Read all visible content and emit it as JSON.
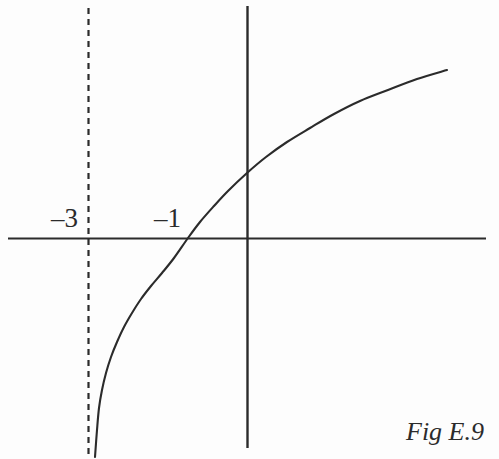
{
  "figure": {
    "caption": "Fig E.9",
    "background_color": "#fdfdfd",
    "ink_color": "#2b2b2b",
    "width": 499,
    "height": 459
  },
  "labels": {
    "neg_three": "–3",
    "neg_one": "–1"
  },
  "chart_data": {
    "type": "line",
    "title": "Fig E.9",
    "subtitle": "",
    "xlabel": "",
    "ylabel": "",
    "grid": false,
    "legend_position": "none",
    "axes": {
      "x_axis": {
        "pixel_y": 238,
        "pixel_x_start": 8,
        "pixel_x_end": 486,
        "visible": true
      },
      "y_axis": {
        "pixel_x": 247,
        "pixel_y_start": 6,
        "pixel_y_end": 448,
        "visible": true
      }
    },
    "tick_labels": [
      {
        "text": "–3",
        "axis": "x",
        "value": -3,
        "pixel_x": 88,
        "pixel_y": 238
      },
      {
        "text": "–1",
        "axis": "x",
        "value": -1,
        "pixel_x": 188,
        "pixel_y": 238
      }
    ],
    "annotations": [
      {
        "kind": "asymptote",
        "orientation": "vertical",
        "value": -3,
        "style": "dashed",
        "pixel_x": 88,
        "pixel_y_start": 8,
        "pixel_y_end": 456
      }
    ],
    "series": [
      {
        "name": "y = ln(x + 3)",
        "style": "solid",
        "color": "#2b2b2b",
        "points_pixels": [
          [
            95,
            457
          ],
          [
            97,
            430
          ],
          [
            99,
            408
          ],
          [
            102,
            390
          ],
          [
            106,
            373
          ],
          [
            111,
            357
          ],
          [
            117,
            342
          ],
          [
            124,
            327
          ],
          [
            132,
            313
          ],
          [
            141,
            299
          ],
          [
            151,
            286
          ],
          [
            162,
            273
          ],
          [
            174,
            258
          ],
          [
            188,
            238
          ],
          [
            200,
            222
          ],
          [
            214,
            206
          ],
          [
            228,
            191
          ],
          [
            247,
            173
          ],
          [
            266,
            157
          ],
          [
            287,
            142
          ],
          [
            310,
            128
          ],
          [
            334,
            114
          ],
          [
            360,
            101
          ],
          [
            388,
            90
          ],
          [
            417,
            79
          ],
          [
            447,
            70
          ]
        ],
        "xlim": [
          -3,
          12
        ],
        "ylim": [
          -4,
          3
        ]
      }
    ]
  }
}
